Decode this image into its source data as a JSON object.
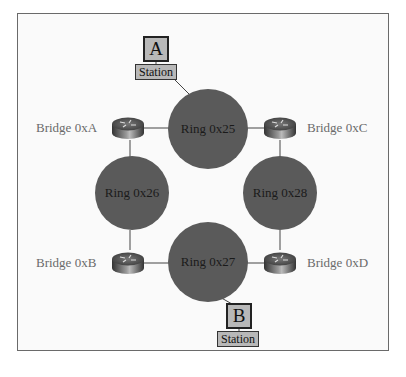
{
  "diagram": {
    "colors": {
      "ring_fill": "#5a5a5a",
      "station_fill": "#b8b8b8",
      "line": "#444444",
      "bridge_label": "#6a6a6a"
    },
    "rings": [
      {
        "id": "ring-0x25",
        "label": "Ring 0x25"
      },
      {
        "id": "ring-0x26",
        "label": "Ring 0x26"
      },
      {
        "id": "ring-0x28",
        "label": "Ring 0x28"
      },
      {
        "id": "ring-0x27",
        "label": "Ring 0x27"
      }
    ],
    "bridges": [
      {
        "id": "bridge-0xa",
        "label": "Bridge 0xA",
        "icon": "router-icon"
      },
      {
        "id": "bridge-0xc",
        "label": "Bridge 0xC",
        "icon": "router-icon"
      },
      {
        "id": "bridge-0xb",
        "label": "Bridge 0xB",
        "icon": "router-icon"
      },
      {
        "id": "bridge-0xd",
        "label": "Bridge 0xD",
        "icon": "router-icon"
      }
    ],
    "stations": [
      {
        "id": "station-a",
        "letter": "A",
        "label": "Station"
      },
      {
        "id": "station-b",
        "letter": "B",
        "label": "Station"
      }
    ]
  }
}
